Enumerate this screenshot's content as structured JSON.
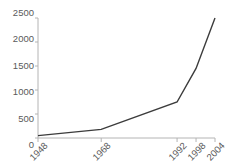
{
  "chart_data": {
    "type": "line",
    "title": "States at the UN",
    "xlabel": "",
    "ylabel": "",
    "categories": [
      "1948",
      "1968",
      "1992",
      "1998",
      "2004"
    ],
    "x": [
      1948,
      1968,
      1992,
      1998,
      2004
    ],
    "values": [
      50,
      180,
      750,
      1450,
      2500
    ],
    "series": [
      {
        "name": "States at the UN",
        "values": [
          50,
          180,
          750,
          1450,
          2500
        ]
      }
    ],
    "ylim": [
      0,
      2500
    ],
    "xlim": [
      1948,
      2004
    ],
    "yticks": [
      0,
      500,
      1000,
      1500,
      2000,
      2500
    ],
    "ytick_labels": [
      "0",
      "500",
      "1000",
      "1500",
      "2000",
      "2500"
    ],
    "xticks": [
      1948,
      1968,
      1992,
      1998,
      2004
    ],
    "xtick_labels": [
      "1948",
      "1968",
      "1992",
      "1998",
      "2004"
    ],
    "grid": false,
    "legend": false,
    "legend_position": "none",
    "line_color": "#3c3c3c",
    "axis_color": "#b4b4b4",
    "tick_label_color": "#5a5a5a",
    "title_color": "#1c1c1c",
    "background_color": "#ffffff"
  }
}
